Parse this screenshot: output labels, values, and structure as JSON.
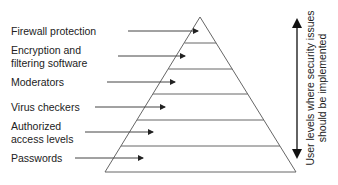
{
  "diagram": {
    "type": "pyramid",
    "levels": [
      {
        "label": "Firewall protection"
      },
      {
        "label": "Encryption and filtering software"
      },
      {
        "label": "Moderators"
      },
      {
        "label": "Virus checkers"
      },
      {
        "label": "Authorized access levels"
      },
      {
        "label": "Passwords"
      }
    ],
    "labels": {
      "firewall": "Firewall protection",
      "encryption_line1": "Encryption and",
      "encryption_line2": "filtering software",
      "moderators": "Moderators",
      "virus": "Virus checkers",
      "authorized_line1": "Authorized",
      "authorized_line2": "access levels",
      "passwords": "Passwords"
    },
    "side_axis": {
      "line1": "User levels where security issues",
      "line2": "should be implemented",
      "direction": "bidirectional"
    },
    "colors": {
      "stroke": "#555555",
      "arrow": "#222222",
      "text": "#222222"
    }
  }
}
